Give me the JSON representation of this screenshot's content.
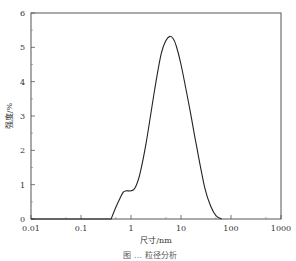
{
  "chart_data": {
    "type": "line",
    "title": "",
    "caption": "图 … 粒径分析",
    "xlabel": "尺寸/nm",
    "ylabel": "强度/%",
    "xscale": "log",
    "xlim": [
      0.01,
      1000
    ],
    "ylim": [
      0,
      6
    ],
    "x_ticks": [
      "0.01",
      "0.1",
      "1",
      "10",
      "100",
      "1000"
    ],
    "y_ticks": [
      "0",
      "1",
      "2",
      "3",
      "4",
      "5",
      "6"
    ],
    "grid": false,
    "legend": null,
    "series": [
      {
        "name": "粒径分布",
        "x": [
          0.4,
          0.5,
          0.6,
          0.7,
          0.8,
          1.0,
          1.2,
          1.5,
          2,
          3,
          4,
          5,
          6,
          7,
          8,
          10,
          15,
          20,
          30,
          40,
          50,
          65
        ],
        "y": [
          0,
          0.35,
          0.6,
          0.78,
          0.82,
          0.82,
          0.9,
          1.3,
          2.2,
          3.8,
          4.8,
          5.2,
          5.32,
          5.25,
          5.05,
          4.5,
          3.2,
          2.2,
          0.9,
          0.35,
          0.1,
          0
        ]
      }
    ],
    "baseline": {
      "x": [
        0.01,
        0.4
      ],
      "y": [
        0,
        0
      ]
    }
  }
}
